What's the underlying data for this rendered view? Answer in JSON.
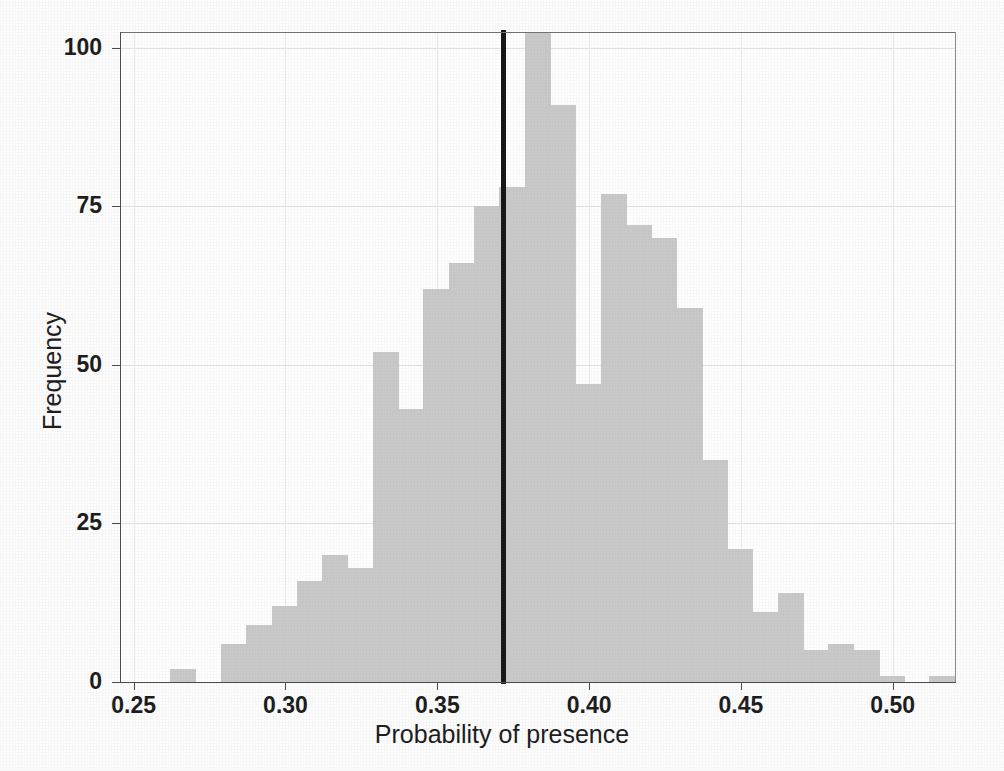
{
  "chart_data": {
    "type": "bar",
    "title": "",
    "subtitle": "",
    "xlabel": "Probability of presence",
    "ylabel": "Frequency",
    "xlim": [
      0.2455,
      0.5205
    ],
    "ylim": [
      0,
      102.5
    ],
    "grid": true,
    "legend": null,
    "bin_width": 0.00833,
    "xticks": [
      0.25,
      0.3,
      0.35,
      0.4,
      0.45,
      0.5
    ],
    "xtick_labels": [
      "0.25",
      "0.30",
      "0.35",
      "0.40",
      "0.45",
      "0.50"
    ],
    "yticks": [
      0,
      25,
      50,
      75,
      100
    ],
    "ytick_labels": [
      "0",
      "25",
      "50",
      "75",
      "100"
    ],
    "annotations": [
      {
        "type": "vline",
        "name": "observed-value-line",
        "x": 0.3717,
        "color": "#141414",
        "width_px": 5
      }
    ],
    "bar_color": "#c9c9c9",
    "bin_left_edges": [
      0.2621,
      0.2704,
      0.2788,
      0.2871,
      0.2954,
      0.3038,
      0.3121,
      0.3204,
      0.3288,
      0.3371,
      0.3454,
      0.3538,
      0.3621,
      0.3704,
      0.3788,
      0.3871,
      0.3954,
      0.4038,
      0.4121,
      0.4204,
      0.4288,
      0.4371,
      0.4454,
      0.4538,
      0.4621,
      0.4704,
      0.4788,
      0.4871,
      0.4954,
      0.5038,
      0.5121
    ],
    "categories": [
      "0.262",
      "0.270",
      "0.279",
      "0.287",
      "0.295",
      "0.304",
      "0.312",
      "0.320",
      "0.329",
      "0.337",
      "0.345",
      "0.354",
      "0.362",
      "0.370",
      "0.379",
      "0.387",
      "0.395",
      "0.404",
      "0.412",
      "0.420",
      "0.429",
      "0.437",
      "0.445",
      "0.454",
      "0.462",
      "0.470",
      "0.479",
      "0.487",
      "0.495",
      "0.504",
      "0.512"
    ],
    "values": [
      2,
      0,
      6,
      9,
      12,
      16,
      20,
      18,
      52,
      43,
      62,
      66,
      75,
      78,
      110,
      91,
      47,
      77,
      72,
      70,
      59,
      35,
      21,
      11,
      14,
      5,
      6,
      5,
      1,
      0,
      1
    ]
  },
  "axes": {
    "y_title": "Frequency",
    "x_title": "Probability of presence"
  }
}
